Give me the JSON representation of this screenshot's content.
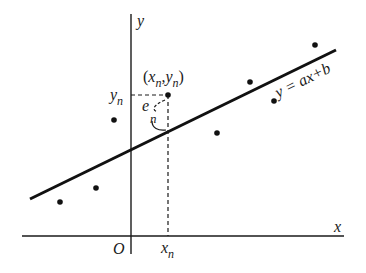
{
  "diagram": {
    "axes": {
      "x_label": "x",
      "y_label": "y",
      "origin_label": "O"
    },
    "regression_line": {
      "equation": "y = ax+b",
      "start": [
        30,
        199
      ],
      "end": [
        336,
        50
      ]
    },
    "highlighted_point": {
      "label_x": "x",
      "label_y": "y",
      "subscript": "n",
      "coord_label_open": "(",
      "coord_label_sep": ",",
      "coord_label_close": ")",
      "residual_label": "e",
      "residual_subscript": "n",
      "axis_x_label": "x",
      "axis_y_label": "y"
    },
    "points": [
      {
        "x": 60,
        "y": 202
      },
      {
        "x": 96,
        "y": 188
      },
      {
        "x": 114,
        "y": 120
      },
      {
        "x": 168,
        "y": 95
      },
      {
        "x": 217,
        "y": 133
      },
      {
        "x": 250,
        "y": 82
      },
      {
        "x": 274,
        "y": 101
      },
      {
        "x": 315,
        "y": 45
      }
    ],
    "colors": {
      "ink": "#1a1a1a",
      "background": "#ffffff"
    }
  }
}
